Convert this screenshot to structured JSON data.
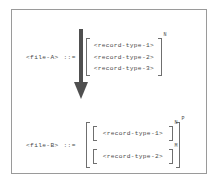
{
  "figure": {
    "type": "bnf-grammar-diagram",
    "border_color": "#9a9a9a",
    "text_color": "#4a4a4a",
    "bracket_color": "#6f6f6f",
    "background": "#ffffff"
  },
  "productions": [
    {
      "id": "a",
      "lhs": "<file-A>",
      "assign": "::=",
      "group_exponent": "N",
      "terms": [
        "<record-type-1>",
        "<record-type-2>",
        "<record-type-3>"
      ]
    },
    {
      "id": "b",
      "lhs": "<file-B>",
      "assign": "::=",
      "group_exponent": "P",
      "inner_groups": [
        {
          "term": "<record-type-1>",
          "exponent": "N"
        },
        {
          "term": "<record-type-2>",
          "exponent": "M"
        }
      ]
    }
  ],
  "arrow": {
    "name": "downward-transform-arrow",
    "direction": "down",
    "color": "#4f4f4f"
  }
}
